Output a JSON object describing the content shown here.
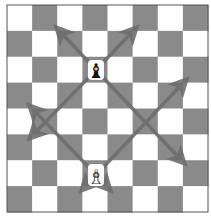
{
  "board": {
    "files": 8,
    "ranks": 8,
    "light_color": "#ffffff",
    "dark_color": "#8a8a8a",
    "border_color": "#555555",
    "top_left_square": "light"
  },
  "pieces": [
    {
      "type": "bishop",
      "color": "black",
      "col": 3,
      "row": 2,
      "glyph": "♝"
    },
    {
      "type": "bishop",
      "color": "white",
      "col": 3,
      "row": 6,
      "glyph": "♗"
    }
  ],
  "arrows": {
    "color": "#6e6e6e",
    "list": [
      {
        "from": "black-bishop",
        "direction": "up-left"
      },
      {
        "from": "black-bishop",
        "direction": "up-right"
      },
      {
        "from": "black-bishop",
        "direction": "down-left"
      },
      {
        "from": "black-bishop",
        "direction": "down-right"
      },
      {
        "from": "white-bishop",
        "direction": "up-left"
      },
      {
        "from": "white-bishop",
        "direction": "up-right"
      },
      {
        "from": "white-bishop",
        "direction": "down-left"
      },
      {
        "from": "white-bishop",
        "direction": "down-right"
      }
    ]
  }
}
